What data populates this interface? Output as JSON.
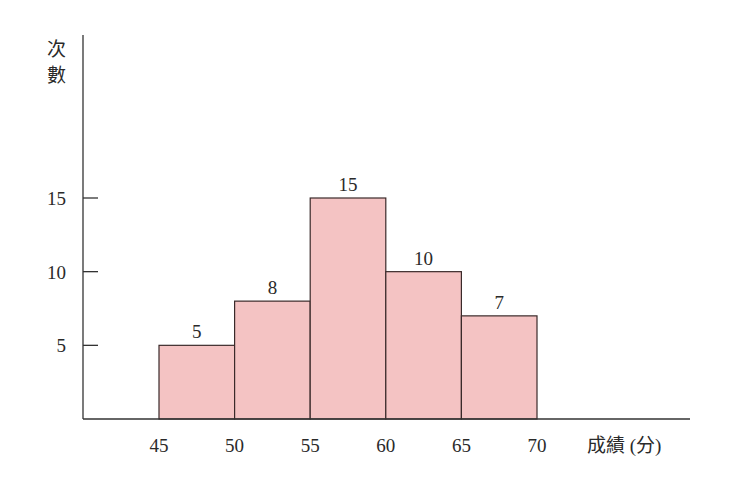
{
  "chart_data": {
    "type": "bar",
    "subtype": "histogram",
    "title": "",
    "xlabel": "成績 (分)",
    "ylabel": "次數",
    "bins": [
      {
        "from": 45,
        "to": 50,
        "value": 5
      },
      {
        "from": 50,
        "to": 55,
        "value": 8
      },
      {
        "from": 55,
        "to": 60,
        "value": 15
      },
      {
        "from": 60,
        "to": 65,
        "value": 10
      },
      {
        "from": 65,
        "to": 70,
        "value": 7
      }
    ],
    "categories": [
      "45-50",
      "50-55",
      "55-60",
      "60-65",
      "65-70"
    ],
    "values": [
      5,
      8,
      15,
      10,
      7
    ],
    "x_ticks": [
      45,
      50,
      55,
      60,
      65,
      70
    ],
    "y_ticks": [
      5,
      10,
      15
    ],
    "ylim": [
      0,
      15
    ],
    "data_labels": [
      "5",
      "8",
      "15",
      "10",
      "7"
    ],
    "grid": false,
    "legend": null
  },
  "colors": {
    "bar_fill": "#F4C3C3",
    "bar_stroke": "#3a2a2a",
    "axis": "#333333"
  },
  "labels": {
    "ylabel_line1": "次",
    "ylabel_line2": "數",
    "xlabel": "成績 (分)"
  }
}
